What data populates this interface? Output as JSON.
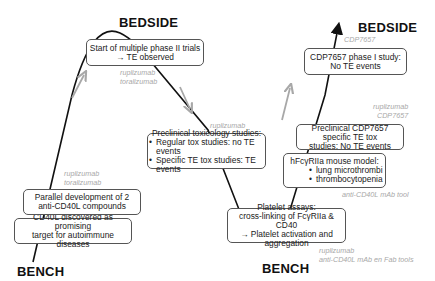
{
  "labels": {
    "bedside_left": "BEDSIDE",
    "bench_left": "BENCH",
    "bench_middle": "BENCH",
    "bedside_right": "BEDSIDE"
  },
  "boxes": {
    "cd40l_discovered": [
      "CD40L discovered as promising",
      "target for autoimmune  diseases"
    ],
    "parallel_development": [
      "Parallel development of 2",
      "anti-CD40L compounds"
    ],
    "phase2_trials": [
      "Start of multiple phase II trials",
      "→ TE observed"
    ],
    "preclinical_tox": {
      "title": "Preclinical toxicology studies:",
      "bullets": [
        "Regular tox studies: no TE events",
        "Specific TE tox studies: TE events"
      ]
    },
    "platelet_assays": [
      "Platelet assays:",
      "cross-linking of FcγRIIa  & CD40",
      "→ Platelet activation and aggregation"
    ],
    "mouse_model": {
      "title": "hFcγRIIa  mouse model:",
      "bullets": [
        "lung microthrombi",
        "thrombocytopenia"
      ]
    },
    "cdp7657_tox": [
      "Preclinical  CDP7657 specific TE tox",
      "studies: No TE events"
    ],
    "cdp7657_phase1": [
      "CDP7657 phase I study:",
      "No TE events"
    ]
  },
  "notes": {
    "left_lower": [
      "ruplizumab",
      "toralizumab"
    ],
    "top": [
      "ruplizumab",
      "toralizumab"
    ],
    "preclinical": [
      "ruplizumab"
    ],
    "platelet": [
      "ruplizumab",
      "anti-CD40L mAb en Fab tools"
    ],
    "mouse": [
      "anti-CD40L mAb tool"
    ],
    "cdp_tox": [
      "ruplizumab",
      "CDP7657"
    ],
    "cdp_top": [
      "CDP7657"
    ]
  },
  "colors": {
    "curve": "#111111",
    "progress_arrow": "#a8a8a8",
    "note_text": "#a8a8a8",
    "box_border": "#555555"
  }
}
